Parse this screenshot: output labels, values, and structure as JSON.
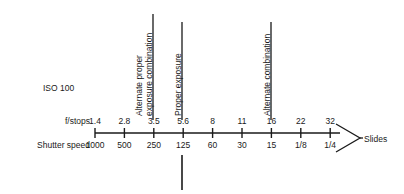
{
  "figure": {
    "type": "exposure-equivalence-scale",
    "iso_label": "ISO 100",
    "row_labels": {
      "fstops": "f/stops",
      "shutter_speed": "Shutter speed"
    },
    "bracket_label": "Slides",
    "axis": {
      "ticks": [
        {
          "fstop": "1.4",
          "shutter": "1000"
        },
        {
          "fstop": "2.8",
          "shutter": "500"
        },
        {
          "fstop": "3.5",
          "shutter": "250"
        },
        {
          "fstop": "5.6",
          "shutter": "125"
        },
        {
          "fstop": "8",
          "shutter": "60"
        },
        {
          "fstop": "11",
          "shutter": "30"
        },
        {
          "fstop": "16",
          "shutter": "15"
        },
        {
          "fstop": "22",
          "shutter": "1/8"
        },
        {
          "fstop": "32",
          "shutter": "1/4"
        }
      ]
    },
    "callouts": [
      {
        "name": "alternate-proper-exposure-combination",
        "line1": "Alternate proper",
        "line2": "exposure combination",
        "tick_index": 2
      },
      {
        "name": "proper-exposure",
        "line1": "Proper exposure",
        "line2": "",
        "tick_index": 3
      },
      {
        "name": "alternate-combination",
        "line1": "Alternate combination",
        "line2": "",
        "tick_index": 6
      }
    ]
  },
  "chart_data": {
    "type": "table",
    "categories": [
      "1.4",
      "2.8",
      "3.5",
      "5.6",
      "8",
      "11",
      "16",
      "22",
      "32"
    ],
    "series": [
      {
        "name": "f/stops",
        "values": [
          "1.4",
          "2.8",
          "3.5",
          "5.6",
          "8",
          "11",
          "16",
          "22",
          "32"
        ]
      },
      {
        "name": "Shutter speed",
        "values": [
          "1000",
          "500",
          "250",
          "125",
          "60",
          "30",
          "15",
          "1/8",
          "1/4"
        ]
      }
    ],
    "xlabel": "",
    "ylabel": "",
    "grid": false,
    "legend": "none",
    "annotations": [
      {
        "text": "Alternate proper exposure combination",
        "at": "3.5 / 250"
      },
      {
        "text": "Proper exposure",
        "at": "5.6 / 125"
      },
      {
        "text": "Alternate combination",
        "at": "16 / 15"
      },
      {
        "text": "Slides",
        "at": "right end of scale"
      },
      {
        "text": "ISO 100",
        "at": "upper left"
      }
    ]
  }
}
